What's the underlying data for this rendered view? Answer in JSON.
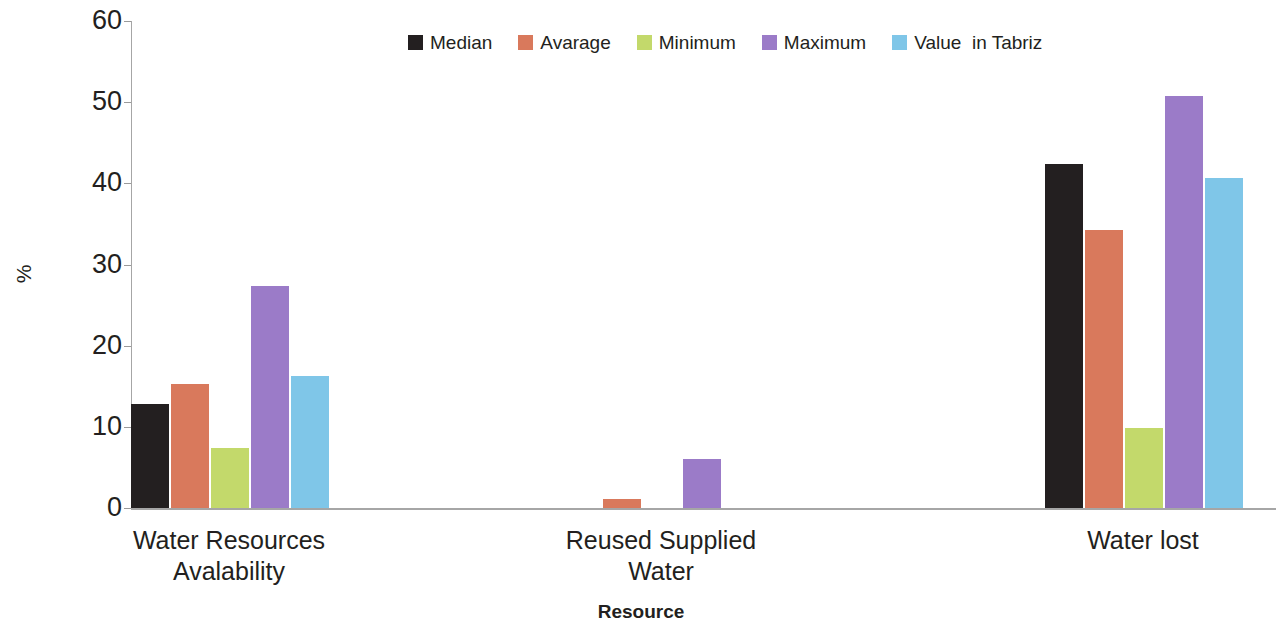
{
  "chart_data": {
    "type": "bar",
    "title": "",
    "xlabel": "Resource",
    "ylabel": "%",
    "ylim": [
      0,
      60
    ],
    "ytick_labels": [
      "60",
      "50",
      "40",
      "30",
      "20",
      "10",
      "0"
    ],
    "ytick_values": [
      60,
      50,
      40,
      30,
      20,
      10,
      0
    ],
    "grid": false,
    "legend_position": "top-center",
    "categories": [
      "Water Resources\nAvalability",
      "Reused Supplied\nWater",
      "Water lost"
    ],
    "category_lines": [
      [
        "Water Resources",
        "Avalability"
      ],
      [
        "Reused Supplied",
        "Water"
      ],
      [
        "Water lost"
      ]
    ],
    "series": [
      {
        "name": "Median",
        "color": "#231f20",
        "values": [
          12.8,
          0,
          42.4
        ]
      },
      {
        "name": "Avarage",
        "color": "#d9795c",
        "values": [
          15.3,
          1.1,
          34.3
        ]
      },
      {
        "name": "Minimum",
        "color": "#c3d96b",
        "values": [
          7.4,
          0,
          9.8
        ]
      },
      {
        "name": "Maximum",
        "color": "#9b7bc8",
        "values": [
          27.4,
          6.0,
          50.8
        ]
      },
      {
        "name": "Value  in Tabriz",
        "color": "#7fc6e8",
        "values": [
          16.3,
          0,
          40.7
        ]
      }
    ]
  },
  "axis": {
    "y_title": "%",
    "x_title": "Resource"
  },
  "legend": {
    "items": [
      {
        "label": "Median",
        "color": "#231f20"
      },
      {
        "label": "Avarage",
        "color": "#d9795c"
      },
      {
        "label": "Minimum",
        "color": "#c3d96b"
      },
      {
        "label": "Maximum",
        "color": "#9b7bc8"
      },
      {
        "label": "Value  in Tabriz",
        "color": "#7fc6e8"
      }
    ]
  }
}
